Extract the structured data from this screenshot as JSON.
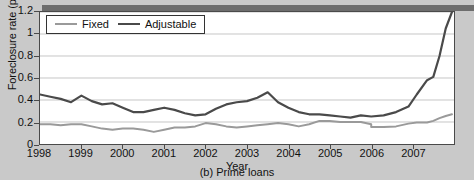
{
  "figure": {
    "caption": "(b) Prime loans",
    "xlabel": "Year",
    "ylabel": "Foreclosure rate (percent)"
  },
  "legend": {
    "position": "top-left",
    "entries": [
      {
        "label": "Fixed",
        "color": "#9a9a9a"
      },
      {
        "label": "Adjustable",
        "color": "#4a4a4a"
      }
    ]
  },
  "axes": {
    "y_ticks": [
      "0",
      "0.2",
      "0.4",
      "0.6",
      "0.8",
      "1",
      "1.2"
    ],
    "x_ticks": [
      "1998",
      "1999",
      "2000",
      "2001",
      "2002",
      "2003",
      "2004",
      "2005",
      "2006",
      "2007"
    ]
  },
  "chart_data": {
    "type": "line",
    "title": "(b) Prime loans",
    "xlabel": "Year",
    "ylabel": "Foreclosure rate (percent)",
    "xlim": [
      1998,
      2008
    ],
    "ylim": [
      0,
      1.2
    ],
    "grid": true,
    "legend_position": "top-left",
    "x": [
      1998.0,
      1998.25,
      1998.5,
      1998.75,
      1999.0,
      1999.25,
      1999.5,
      1999.75,
      2000.0,
      2000.25,
      2000.5,
      2000.75,
      2001.0,
      2001.25,
      2001.5,
      2001.75,
      2002.0,
      2002.25,
      2002.5,
      2002.75,
      2003.0,
      2003.25,
      2003.5,
      2003.75,
      2004.0,
      2004.25,
      2004.5,
      2004.75,
      2005.0,
      2005.25,
      2005.5,
      2005.75,
      2006.0,
      2006.25,
      2006.5,
      2006.75,
      2007.0,
      2007.25,
      2007.5,
      2007.75
    ],
    "series": [
      {
        "name": "Fixed",
        "color": "#9a9a9a",
        "values": [
          0.18,
          0.18,
          0.17,
          0.18,
          0.18,
          0.16,
          0.14,
          0.13,
          0.14,
          0.14,
          0.13,
          0.11,
          0.13,
          0.15,
          0.15,
          0.16,
          0.19,
          0.18,
          0.16,
          0.15,
          0.16,
          0.17,
          0.18,
          0.19,
          0.18,
          0.16,
          0.18,
          0.21,
          0.21,
          0.2,
          0.2,
          0.2,
          0.18,
          0.16,
          0.16,
          0.16,
          0.18,
          0.2,
          0.23,
          0.27
        ]
      },
      {
        "name": "Adjustable",
        "color": "#4a4a4a",
        "values": [
          0.45,
          0.43,
          0.41,
          0.38,
          0.44,
          0.39,
          0.36,
          0.37,
          0.33,
          0.29,
          0.29,
          0.31,
          0.33,
          0.31,
          0.28,
          0.26,
          0.27,
          0.32,
          0.36,
          0.38,
          0.39,
          0.42,
          0.47,
          0.38,
          0.33,
          0.29,
          0.27,
          0.27,
          0.26,
          0.25,
          0.24,
          0.26,
          0.25,
          0.23,
          0.21,
          0.2,
          0.21,
          0.2,
          0.21,
          0.21
        ]
      }
    ],
    "annotations": [
      {
        "text": "Adjustable peak",
        "x": 2001.7,
        "y": 0.47
      },
      {
        "text": "Adjustable sharp rise begins",
        "x": 2006.3,
        "y": 0.25
      },
      {
        "text": "Adjustable end value",
        "x": 2007.9,
        "y": 1.2
      }
    ],
    "extended_tail": {
      "note": "Adjustable rises steeply after mid-2006",
      "x": [
        2006.0,
        2006.3,
        2006.6,
        2006.9,
        2007.1,
        2007.35,
        2007.5,
        2007.65,
        2007.8,
        2007.95
      ],
      "adjustable": [
        0.25,
        0.26,
        0.29,
        0.34,
        0.45,
        0.58,
        0.61,
        0.8,
        1.05,
        1.2
      ],
      "fixed": [
        0.155,
        0.155,
        0.16,
        0.185,
        0.195,
        0.195,
        0.21,
        0.235,
        0.255,
        0.27
      ]
    }
  }
}
